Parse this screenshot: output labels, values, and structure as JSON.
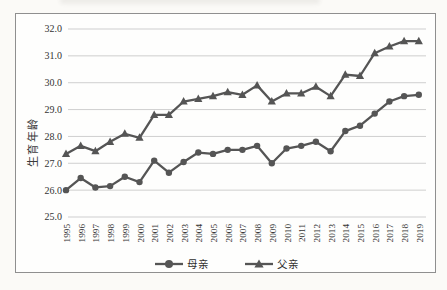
{
  "page": {
    "background": "#fbfaf7",
    "frame_border_color": "#8f8f8f"
  },
  "chart_data": {
    "type": "line",
    "title": "",
    "xlabel": "",
    "ylabel": "生育年龄",
    "ylim": [
      25.0,
      32.0
    ],
    "y_ticks": [
      "25.0",
      "26.0",
      "27.0",
      "28.0",
      "29.0",
      "30.0",
      "31.0",
      "32.0"
    ],
    "grid": true,
    "legend_position": "bottom",
    "line_color": "#555555",
    "gridline_color": "#c9c9c9",
    "tick_label_color": "#333333",
    "categories": [
      "1995",
      "1996",
      "1997",
      "1998",
      "1999",
      "2000",
      "2001",
      "2002",
      "2003",
      "2004",
      "2005",
      "2006",
      "2007",
      "2008",
      "2009",
      "2010",
      "2011",
      "2012",
      "2013",
      "2014",
      "2015",
      "2016",
      "2017",
      "2018",
      "2019"
    ],
    "series": [
      {
        "name": "母亲",
        "marker": "circle",
        "values": [
          26.0,
          26.45,
          26.1,
          26.15,
          26.5,
          26.3,
          27.1,
          26.65,
          27.05,
          27.4,
          27.35,
          27.5,
          27.5,
          27.65,
          27.0,
          27.55,
          27.65,
          27.8,
          27.45,
          28.2,
          28.4,
          28.85,
          29.3,
          29.5,
          29.55
        ]
      },
      {
        "name": "父亲",
        "marker": "triangle",
        "values": [
          27.35,
          27.65,
          27.45,
          27.8,
          28.1,
          27.95,
          28.8,
          28.8,
          29.3,
          29.4,
          29.5,
          29.65,
          29.55,
          29.9,
          29.3,
          29.6,
          29.6,
          29.85,
          29.5,
          30.3,
          30.25,
          31.1,
          31.35,
          31.55,
          31.55
        ]
      }
    ]
  }
}
